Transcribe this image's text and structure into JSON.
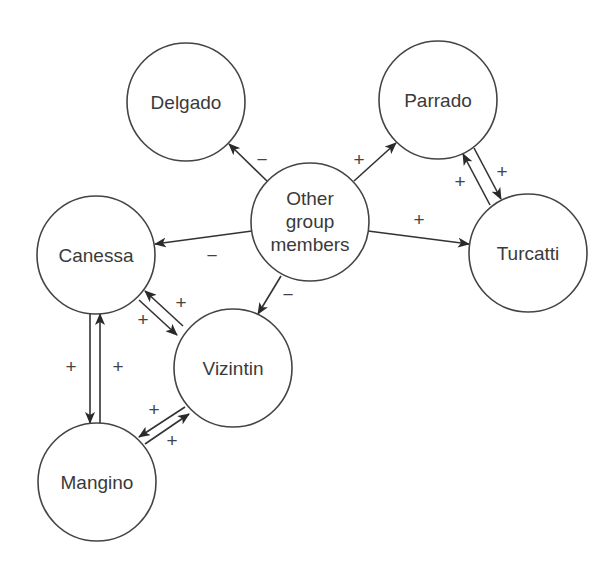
{
  "diagram": {
    "type": "signed-directed-graph",
    "nodes": [
      {
        "id": "delgado",
        "lines": [
          "Delgado"
        ],
        "cx": 186,
        "cy": 102,
        "r": 59
      },
      {
        "id": "parrado",
        "lines": [
          "Parrado"
        ],
        "cx": 438,
        "cy": 100,
        "r": 59
      },
      {
        "id": "other",
        "lines": [
          "Other",
          "group",
          "members"
        ],
        "cx": 310,
        "cy": 222,
        "r": 59
      },
      {
        "id": "canessa",
        "lines": [
          "Canessa"
        ],
        "cx": 96,
        "cy": 255,
        "r": 59
      },
      {
        "id": "turcatti",
        "lines": [
          "Turcatti"
        ],
        "cx": 528,
        "cy": 253,
        "r": 59
      },
      {
        "id": "vizintin",
        "lines": [
          "Vizintin"
        ],
        "cx": 233,
        "cy": 368,
        "r": 59
      },
      {
        "id": "mangino",
        "lines": [
          "Mangino"
        ],
        "cx": 97,
        "cy": 482,
        "r": 59
      }
    ],
    "edges": [
      {
        "from": "other",
        "to": "delgado",
        "sign": "−",
        "x1": 267,
        "y1": 181,
        "x2": 229,
        "y2": 144,
        "lx": 262,
        "ly": 160
      },
      {
        "from": "other",
        "to": "parrado",
        "sign": "+",
        "x1": 354,
        "y1": 181,
        "x2": 396,
        "y2": 143,
        "lx": 359,
        "ly": 160
      },
      {
        "from": "other",
        "to": "canessa",
        "sign": "−",
        "x1": 252,
        "y1": 231,
        "x2": 155,
        "y2": 244,
        "lx": 212,
        "ly": 256
      },
      {
        "from": "other",
        "to": "turcatti",
        "sign": "+",
        "x1": 368,
        "y1": 231,
        "x2": 469,
        "y2": 244,
        "lx": 419,
        "ly": 226
      },
      {
        "from": "other",
        "to": "vizintin",
        "sign": "−",
        "x1": 281,
        "y1": 276,
        "x2": 258,
        "y2": 314,
        "lx": 288,
        "ly": 301
      },
      {
        "from": "parrado",
        "to": "turcatti",
        "sign": "+",
        "x1": 474,
        "y1": 148,
        "x2": 501,
        "y2": 199,
        "lx": 502,
        "ly": 177
      },
      {
        "from": "turcatti",
        "to": "parrado",
        "sign": "+",
        "x1": 490,
        "y1": 205,
        "x2": 463,
        "y2": 154,
        "lx": 460,
        "ly": 187
      },
      {
        "from": "vizintin",
        "to": "canessa",
        "sign": "+",
        "x1": 183,
        "y1": 326,
        "x2": 145,
        "y2": 291,
        "lx": 181,
        "ly": 307
      },
      {
        "from": "canessa",
        "to": "vizintin",
        "sign": "+",
        "x1": 139,
        "y1": 300,
        "x2": 177,
        "y2": 335,
        "lx": 143,
        "ly": 325
      },
      {
        "from": "mangino",
        "to": "canessa",
        "sign": "+",
        "x1": 100,
        "y1": 423,
        "x2": 100,
        "y2": 314,
        "lx": 118,
        "ly": 372
      },
      {
        "from": "canessa",
        "to": "mangino",
        "sign": "+",
        "x1": 90,
        "y1": 314,
        "x2": 90,
        "y2": 423,
        "lx": 71,
        "ly": 372
      },
      {
        "from": "vizintin",
        "to": "mangino",
        "sign": "+",
        "x1": 185,
        "y1": 407,
        "x2": 139,
        "y2": 437,
        "lx": 154,
        "ly": 415
      },
      {
        "from": "mangino",
        "to": "vizintin",
        "sign": "+",
        "x1": 145,
        "y1": 444,
        "x2": 189,
        "y2": 414,
        "lx": 172,
        "ly": 445
      }
    ]
  },
  "labels": {
    "delgado": "Delgado",
    "parrado": "Parrado",
    "other_1": "Other",
    "other_2": "group",
    "other_3": "members",
    "canessa": "Canessa",
    "turcatti": "Turcatti",
    "vizintin": "Vizintin",
    "mangino": "Mangino",
    "sign_other_delgado": "−",
    "sign_other_parrado": "+",
    "sign_other_canessa": "−",
    "sign_other_turcatti": "+",
    "sign_other_vizintin": "−",
    "sign_parrado_turcatti": "+",
    "sign_turcatti_parrado": "+",
    "sign_vizintin_canessa": "+",
    "sign_canessa_vizintin": "+",
    "sign_mangino_canessa": "+",
    "sign_canessa_mangino": "+",
    "sign_vizintin_mangino": "+",
    "sign_mangino_vizintin": "+"
  }
}
